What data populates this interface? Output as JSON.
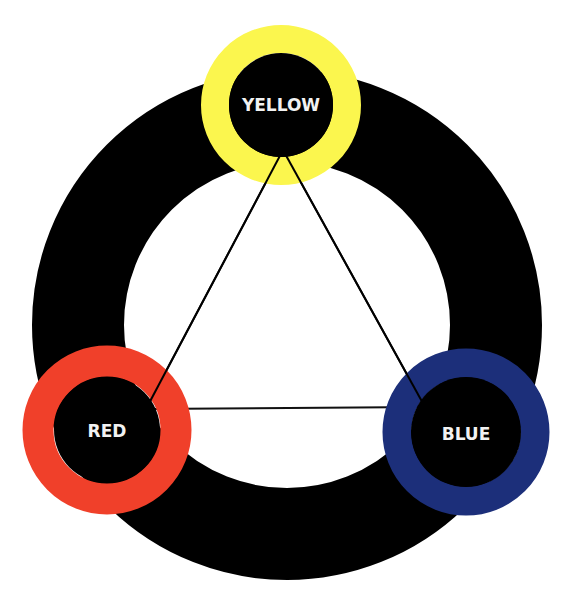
{
  "colors": {
    "outer_ring": "#000000",
    "yellow": "#fbf64e",
    "red": "#f0402a",
    "blue": "#1c2f7a",
    "label": "#f2f2f2",
    "triangle": "#111111"
  },
  "nodes": [
    {
      "id": "yellow",
      "label": "YELLOW"
    },
    {
      "id": "red",
      "label": "RED"
    },
    {
      "id": "blue",
      "label": "BLUE"
    }
  ]
}
